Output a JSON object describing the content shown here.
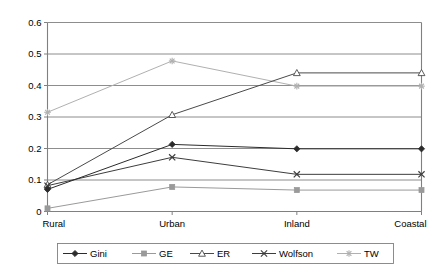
{
  "chart_data": {
    "type": "line",
    "title": "",
    "subtitle": "",
    "xlabel": "",
    "ylabel": "",
    "categories": [
      "Rural",
      "Urban",
      "Inland",
      "Coastal"
    ],
    "ylim": [
      0,
      0.6
    ],
    "ytick_labels": [
      "0",
      "0.1",
      "0.2",
      "0.3",
      "0.4",
      "0.5",
      "0.6"
    ],
    "ytick_values": [
      0,
      0.1,
      0.2,
      0.3,
      0.4,
      0.5,
      0.6
    ],
    "grid": "horizontal",
    "legend_position": "bottom",
    "series": [
      {
        "name": "Gini",
        "values": [
          0.07,
          0.213,
          0.199,
          0.199
        ],
        "color": "#2b2b2b",
        "marker": "diamond-filled"
      },
      {
        "name": "GE",
        "values": [
          0.01,
          0.078,
          0.068,
          0.068
        ],
        "color": "#9a9a9a",
        "marker": "square-filled"
      },
      {
        "name": "ER",
        "values": [
          0.085,
          0.307,
          0.44,
          0.44
        ],
        "color": "#4a4a4a",
        "marker": "triangle-open"
      },
      {
        "name": "Wolfson",
        "values": [
          0.082,
          0.172,
          0.118,
          0.118
        ],
        "color": "#3d3d3d",
        "marker": "cross-x"
      },
      {
        "name": "TW",
        "values": [
          0.315,
          0.478,
          0.398,
          0.398
        ],
        "color": "#b0b0b0",
        "marker": "asterisk"
      }
    ]
  },
  "legend": {
    "items": [
      {
        "label": "Gini"
      },
      {
        "label": "GE"
      },
      {
        "label": "ER"
      },
      {
        "label": "Wolfson"
      },
      {
        "label": "TW"
      }
    ]
  },
  "axis": {
    "x_categories": [
      "Rural",
      "Urban",
      "Inland",
      "Coastal"
    ],
    "y_labels": [
      "0.6",
      "0.5",
      "0.4",
      "0.3",
      "0.2",
      "0.1",
      "0"
    ]
  },
  "colors": {
    "plot_border": "#808080",
    "gridline": "#808080",
    "background": "#ffffff"
  }
}
